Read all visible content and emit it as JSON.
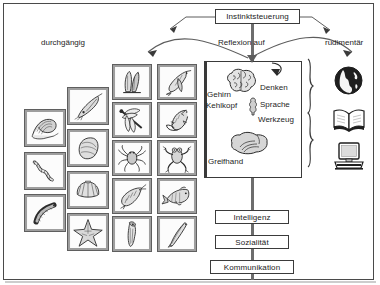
{
  "diagram": {
    "title_box": {
      "label": "Instinktsteuerung"
    },
    "branch_labels": {
      "left": "durchgängig",
      "center": "Reflexion auf",
      "right": "rudimentär"
    },
    "human_traits": [
      {
        "id": "gehirn",
        "label": "Gehirn",
        "icon": "brain-icon"
      },
      {
        "id": "denken",
        "label": "Denken",
        "icon": "thinking-icon"
      },
      {
        "id": "kehlkopf",
        "label": "Kehlkopf",
        "icon": "larynx-icon"
      },
      {
        "id": "sprache",
        "label": "Sprache",
        "icon": "speech-icon"
      },
      {
        "id": "werkzeug",
        "label": "Werkzeug",
        "icon": "tool-icon"
      },
      {
        "id": "greifhand",
        "label": "Greifhand",
        "icon": "hand-icon"
      }
    ],
    "outcome_boxes": [
      {
        "id": "intelligenz",
        "label": "Intelligenz"
      },
      {
        "id": "sozialitaet",
        "label": "Sozialität"
      },
      {
        "id": "kommunikation",
        "label": "Kommunikation"
      }
    ],
    "culture_icons": [
      {
        "id": "globe",
        "name": "globe-icon",
        "alt": "Globus"
      },
      {
        "id": "book",
        "name": "open-book-icon",
        "alt": "Buch"
      },
      {
        "id": "computer",
        "name": "computer-icon",
        "alt": "Computer"
      }
    ],
    "animal_columns": [
      {
        "id": "col1",
        "tiles": [
          {
            "id": "snail",
            "name": "snail-tile",
            "alt": "Schnecke"
          },
          {
            "id": "ringworm",
            "name": "segmented-worm-tile",
            "alt": "Ringelwurm"
          },
          {
            "id": "worm",
            "name": "worm-tile",
            "alt": "Wurm"
          }
        ]
      },
      {
        "id": "col2",
        "tiles": [
          {
            "id": "squidlet",
            "name": "cephalopod-tile",
            "alt": "Tintenfisch"
          },
          {
            "id": "mussel",
            "name": "mussel-tile",
            "alt": "Muschel"
          },
          {
            "id": "scallop",
            "name": "scallop-tile",
            "alt": "Kammmuschel"
          },
          {
            "id": "starfish",
            "name": "starfish-tile",
            "alt": "Seestern"
          }
        ]
      },
      {
        "id": "col3",
        "tiles": [
          {
            "id": "larva",
            "name": "larva-tile",
            "alt": "Larve"
          },
          {
            "id": "dragonfly",
            "name": "dragonfly-tile",
            "alt": "Libelle"
          },
          {
            "id": "spider",
            "name": "spider-tile",
            "alt": "Spinne"
          },
          {
            "id": "shrimp",
            "name": "shrimp-tile",
            "alt": "Garnele"
          },
          {
            "id": "squid",
            "name": "squid-tile",
            "alt": "Kalmar"
          }
        ]
      },
      {
        "id": "col4",
        "tiles": [
          {
            "id": "bird",
            "name": "bird-tile",
            "alt": "Vogel"
          },
          {
            "id": "lizard",
            "name": "lizard-tile",
            "alt": "Eidechse"
          },
          {
            "id": "frog",
            "name": "frog-tile",
            "alt": "Frosch"
          },
          {
            "id": "fish",
            "name": "fish-tile",
            "alt": "Fisch"
          },
          {
            "id": "eel",
            "name": "eel-tile",
            "alt": "Aal"
          }
        ]
      }
    ],
    "colors": {
      "frame": "#4a4a4a",
      "line": "#5d5d5d",
      "text": "#1e1e1e",
      "tile_border": "#9e9e9e",
      "tile_fill": "#f2f2f2",
      "ink": "#2b2b2b"
    }
  }
}
